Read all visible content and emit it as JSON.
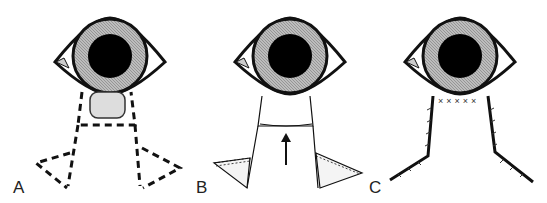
{
  "figure": {
    "panels": [
      {
        "id": "A",
        "label": "A",
        "description": "Eyelid lesion below eye with dashed excision outline and lateral triangles"
      },
      {
        "id": "B",
        "label": "B",
        "description": "Excised defect with advancement flap and arrow indicating upward advancement; hatched Burow's triangles"
      },
      {
        "id": "C",
        "label": "C",
        "description": "Closed flap with sutures along margins and lid edge"
      }
    ],
    "colors": {
      "line": "#111111",
      "iris": "#9a9a9a",
      "pupil": "#000000",
      "background": "#ffffff"
    }
  }
}
